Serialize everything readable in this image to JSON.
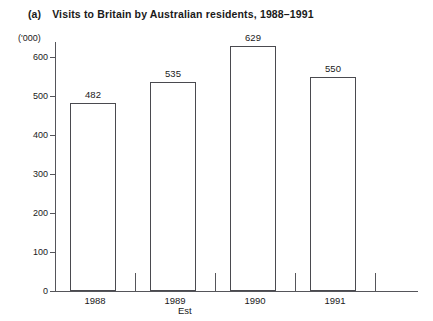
{
  "title": {
    "index": "(a)",
    "text": "Visits to Britain by Australian residents, 1988–1991"
  },
  "chart_data": {
    "type": "bar",
    "title": "Visits to Britain by Australian residents, 1988–1991",
    "categories": [
      "1988",
      "1989",
      "1990",
      "1991"
    ],
    "values": [
      482,
      535,
      629,
      550
    ],
    "xlabel": "Est",
    "ylabel": "('000)",
    "ylim": [
      0,
      600
    ],
    "yticks": [
      0,
      100,
      200,
      300,
      400,
      500,
      600
    ],
    "ytick_labels": [
      "0",
      "100",
      "200",
      "300",
      "400",
      "500",
      "600"
    ],
    "grid": false,
    "legend": false,
    "bar_fill": "#ffffff",
    "bar_edge": "#4a4a4f",
    "axis_color": "#55555a",
    "background": "#ffffff",
    "value_labels": [
      "482",
      "535",
      "629",
      "550"
    ]
  }
}
